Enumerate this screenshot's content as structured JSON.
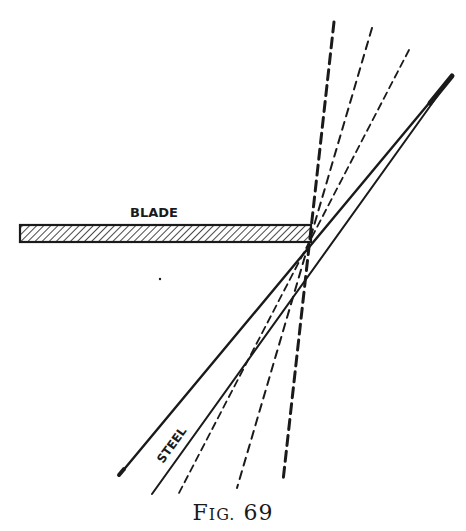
{
  "figure": {
    "caption_prefix": "F",
    "caption_smallcaps": "IG.",
    "caption_number": "69",
    "caption_full": "Fig. 69"
  },
  "labels": {
    "blade": "BLADE",
    "steel": "STEEL"
  },
  "geometry": {
    "blade": {
      "x1": 20,
      "x2": 311,
      "y_top": 225,
      "y_bottom": 242
    },
    "steel_left_edge": {
      "from": [
        450,
        78
      ],
      "to": [
        121,
        473
      ]
    },
    "steel_right_edge": {
      "from": [
        446,
        84
      ],
      "to": [
        152,
        494
      ]
    },
    "dashed_lines": [
      {
        "style": "heavy-dashed",
        "from": [
          334,
          22
        ],
        "to": [
          283,
          481
        ]
      },
      {
        "style": "dashed",
        "from": [
          372,
          28
        ],
        "to": [
          237,
          488
        ]
      },
      {
        "style": "dash-dot",
        "from": [
          409,
          50
        ],
        "to": [
          179,
          493
        ]
      }
    ]
  },
  "colors": {
    "ink": "#1a1a1a",
    "paper": "#ffffff"
  }
}
